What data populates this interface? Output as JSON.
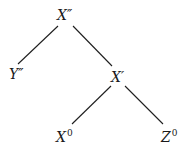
{
  "diagram": {
    "type": "tree",
    "nodes": [
      {
        "id": "Xpp",
        "base": "X",
        "mark": "″",
        "x": 57,
        "y": 7
      },
      {
        "id": "Ypp",
        "base": "Y",
        "mark": "″",
        "x": 9,
        "y": 66
      },
      {
        "id": "Xp",
        "base": "X",
        "mark": "′",
        "x": 111,
        "y": 69
      },
      {
        "id": "X0",
        "base": "X",
        "mark": "0",
        "x": 56,
        "y": 125
      },
      {
        "id": "Z0",
        "base": "Z",
        "mark": "0",
        "x": 161,
        "y": 125
      }
    ],
    "edges": [
      {
        "from": "Xpp",
        "to": "Ypp"
      },
      {
        "from": "Xpp",
        "to": "Xp"
      },
      {
        "from": "Xp",
        "to": "X0"
      },
      {
        "from": "Xp",
        "to": "Z0"
      }
    ]
  }
}
